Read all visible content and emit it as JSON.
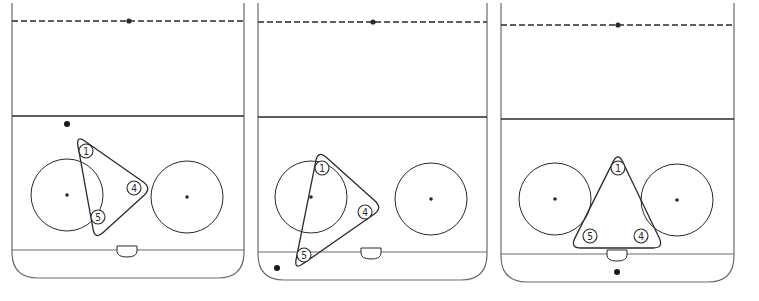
{
  "colors": {
    "line": "#2a2a2a",
    "rink": "#6a6a6a",
    "background": "#ffffff"
  },
  "panels": [
    {
      "name": "panel-1",
      "left": 12,
      "right": 244,
      "top": 3,
      "red_line_y": 21,
      "center_dot": [
        129,
        21
      ],
      "blue_line_y": 116,
      "goal_line_y": 250,
      "bottom_y": 278,
      "corner_radius": 26,
      "crease": [
        127,
        250
      ],
      "faceoff_circles": [
        {
          "cx": 67,
          "cy": 195,
          "r": 36
        },
        {
          "cx": 187,
          "cy": 197,
          "r": 36
        }
      ],
      "triangle": [
        [
          76,
          135
        ],
        [
          152,
          188
        ],
        [
          95,
          240
        ]
      ],
      "players": [
        {
          "label": "1",
          "x": 86,
          "y": 151
        },
        {
          "label": "4",
          "x": 134,
          "y": 188
        },
        {
          "label": "5",
          "x": 98,
          "y": 217
        }
      ],
      "puck": [
        67,
        124
      ]
    },
    {
      "name": "panel-2",
      "left": 258,
      "right": 487,
      "top": 3,
      "red_line_y": 22,
      "center_dot": [
        373,
        22
      ],
      "blue_line_y": 117,
      "goal_line_y": 252,
      "bottom_y": 280,
      "corner_radius": 26,
      "crease": [
        371,
        252
      ],
      "faceoff_circles": [
        {
          "cx": 311,
          "cy": 197,
          "r": 36
        },
        {
          "cx": 431,
          "cy": 199,
          "r": 36
        }
      ],
      "triangle": [
        [
          318,
          150
        ],
        [
          383,
          208
        ],
        [
          294,
          270
        ]
      ],
      "players": [
        {
          "label": "1",
          "x": 322,
          "y": 168
        },
        {
          "label": "4",
          "x": 365,
          "y": 212
        },
        {
          "label": "5",
          "x": 304,
          "y": 255
        }
      ],
      "puck": [
        277,
        268
      ]
    },
    {
      "name": "panel-3",
      "left": 501,
      "right": 734,
      "top": 3,
      "red_line_y": 25,
      "center_dot": [
        618,
        25
      ],
      "blue_line_y": 119,
      "goal_line_y": 254,
      "bottom_y": 282,
      "corner_radius": 26,
      "crease": [
        617,
        254
      ],
      "faceoff_circles": [
        {
          "cx": 555,
          "cy": 199,
          "r": 36
        },
        {
          "cx": 677,
          "cy": 200,
          "r": 36
        }
      ],
      "triangle": [
        [
          618,
          152
        ],
        [
          570,
          248
        ],
        [
          664,
          248
        ]
      ],
      "players": [
        {
          "label": "1",
          "x": 618,
          "y": 168
        },
        {
          "label": "5",
          "x": 590,
          "y": 236
        },
        {
          "label": "4",
          "x": 641,
          "y": 236
        }
      ],
      "puck": [
        617,
        272
      ]
    }
  ]
}
